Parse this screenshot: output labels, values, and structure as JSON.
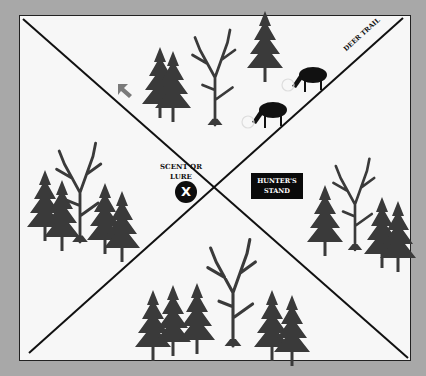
{
  "diagram": {
    "labels": {
      "scent": "SCENT OR LURE",
      "scent_line1": "SCENT OR",
      "scent_line2": "LURE",
      "scent_marker": "X",
      "stand_line1": "HUNTER'S",
      "stand_line2": "STAND",
      "trail": "DEER TRAIL"
    },
    "quadrants": [
      "top",
      "left",
      "right",
      "bottom"
    ],
    "elements": {
      "deer_count": 2,
      "wind_arrow": "gray arrow pointing down-right",
      "colors": {
        "background": "#a8a8a8",
        "panel": "#f7f7f7",
        "ink": "#111111",
        "tree": "#3a3a3a",
        "arrow": "#7a7a7a"
      }
    }
  }
}
